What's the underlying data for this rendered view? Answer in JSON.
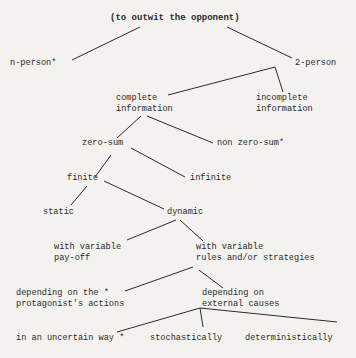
{
  "diagram": {
    "type": "tree",
    "root": "(to outwit the opponent)",
    "nodes": {
      "root": "(to outwit the opponent)",
      "n_person": "n-person*",
      "two_person": "2-person",
      "complete_1": "complete",
      "complete_2": "information",
      "incomplete_1": "incomplete",
      "incomplete_2": "information",
      "zero_sum": "zero-sum",
      "non_zero_sum": "non zero-sum*",
      "finite": "finite",
      "infinite": "infinite",
      "static": "static",
      "dynamic": "dynamic",
      "var_payoff_1": "with variable",
      "var_payoff_2": "pay-off",
      "var_rules_1": "with variable",
      "var_rules_2": "rules and/or strategies",
      "dep_protag_1": "depending on the *",
      "dep_protag_2": "protagonist's actions",
      "dep_ext_1": "depending on",
      "dep_ext_2": "external causes",
      "uncertain": "in an uncertain way *",
      "stochastic": "stochastically",
      "deterministic": "deterministically"
    },
    "edges": [
      [
        "(to outwit the opponent)",
        "n-person*"
      ],
      [
        "(to outwit the opponent)",
        "2-person"
      ],
      [
        "2-person",
        "complete information"
      ],
      [
        "2-person",
        "incomplete information"
      ],
      [
        "complete information",
        "zero-sum"
      ],
      [
        "complete information",
        "non zero-sum*"
      ],
      [
        "zero-sum",
        "finite"
      ],
      [
        "zero-sum",
        "infinite"
      ],
      [
        "finite",
        "static"
      ],
      [
        "finite",
        "dynamic"
      ],
      [
        "dynamic",
        "with variable pay-off"
      ],
      [
        "dynamic",
        "with variable rules and/or strategies"
      ],
      [
        "with variable rules and/or strategies",
        "depending on the * protagonist's actions"
      ],
      [
        "with variable rules and/or strategies",
        "depending on external causes"
      ],
      [
        "depending on external causes",
        "in an uncertain way *"
      ],
      [
        "depending on external causes",
        "stochastically"
      ],
      [
        "depending on external causes",
        "deterministically"
      ]
    ],
    "colors": {
      "background": "#f3f2ef",
      "ink": "#2a2a2a"
    }
  }
}
